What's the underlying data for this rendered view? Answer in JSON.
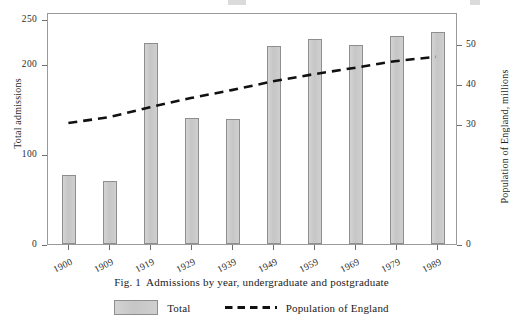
{
  "figure": {
    "caption_number": "Fig. 1",
    "caption_text": "Admissions by year, undergraduate and postgraduate"
  },
  "legend": {
    "position": "bottom-center",
    "entries": [
      {
        "label": "Total",
        "marker": "bar-swatch",
        "color": "#c9c9c9"
      },
      {
        "label": "Population of England",
        "marker": "dashed-line",
        "color": "#111111"
      }
    ]
  },
  "axes": {
    "left": {
      "title": "Total admissions",
      "ticks": [
        "0",
        "100",
        "200",
        "250"
      ],
      "tick_values": [
        0,
        100,
        200,
        250
      ],
      "range": [
        0,
        258
      ]
    },
    "right": {
      "title": "Population of England, millions",
      "ticks": [
        "0",
        "30",
        "40",
        "50"
      ],
      "tick_values": [
        0,
        30,
        40,
        50
      ],
      "range": [
        0,
        58
      ]
    },
    "x": {
      "ticks": [
        "1900",
        "1909",
        "1919",
        "1929",
        "1939",
        "1949",
        "1959",
        "1969",
        "1979",
        "1989"
      ]
    }
  },
  "chart_data": {
    "type": "bar",
    "xlabel": "",
    "ylabel": "Total admissions",
    "y2label": "Population of England, millions",
    "grid": false,
    "legend_position": "bottom-center",
    "categories": [
      "1900",
      "1909",
      "1919",
      "1929",
      "1939",
      "1949",
      "1959",
      "1969",
      "1979",
      "1989"
    ],
    "ylim": [
      0,
      258
    ],
    "y2lim": [
      0,
      58
    ],
    "series": [
      {
        "name": "Total",
        "type": "bar",
        "axis": "left",
        "color": "#c9c9c9",
        "values": [
          77,
          70,
          223,
          140,
          139,
          220,
          228,
          221,
          231,
          236
        ]
      },
      {
        "name": "Population of England",
        "type": "line",
        "style": "dashed",
        "axis": "right",
        "color": "#111111",
        "values": [
          30.5,
          32.0,
          34.5,
          36.8,
          38.8,
          41.0,
          42.8,
          44.4,
          46.1,
          47.2
        ]
      }
    ]
  }
}
